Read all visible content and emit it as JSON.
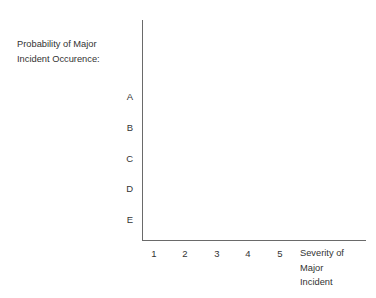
{
  "figure": {
    "background_color": "#ffffff",
    "text_color": "#333333",
    "axis_color": "#6a6a6a"
  },
  "chart_data": {
    "type": "scatter",
    "title": "",
    "subtitle": "",
    "ylabel": "Probability of Major\nIncident Occurence:",
    "xlabel": "Severity of\nMajor\nIncident",
    "y_tick_labels": [
      "A",
      "B",
      "C",
      "D",
      "E"
    ],
    "x_tick_labels": [
      "1",
      "2",
      "3",
      "4",
      "5"
    ],
    "x": [],
    "values": [],
    "series": [],
    "annotations": [],
    "legend": [],
    "legend_position": "none",
    "grid": false,
    "xlim": [
      0.5,
      5.5
    ],
    "ylim": [
      0.5,
      5.5
    ]
  }
}
